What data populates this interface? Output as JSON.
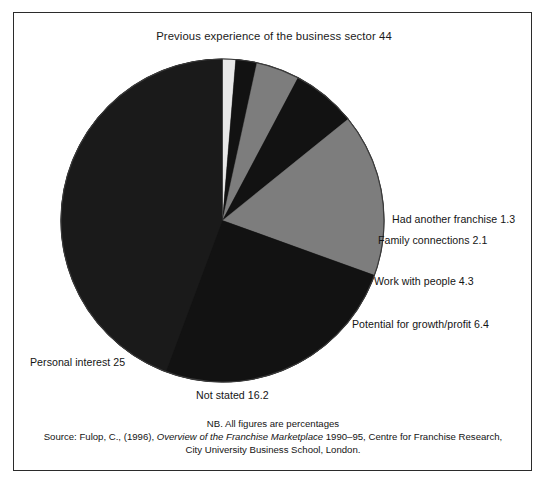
{
  "figure": {
    "title": "Previous experience of the business sector 44",
    "border_color": "#2b2b2b",
    "background": "#ffffff"
  },
  "footnote": {
    "note": "NB. All figures are percentages",
    "source_prefix": "Source: Fulop, C., (1996), ",
    "source_italic": "Overview of the Franchise Marketplace",
    "source_suffix": " 1990–95, Centre for Franchise Research,",
    "source_line3": "City University Business School, London."
  },
  "labels": {
    "had_another_franchise": "Had another franchise 1.3",
    "family_connections": "Family connections 2.1",
    "work_with_people": "Work with people 4.3",
    "potential_growth_profit": "Potential for growth/profit 6.4",
    "personal_interest": "Personal interest 25",
    "not_stated": "Not stated 16.2"
  },
  "chart_data": {
    "type": "pie",
    "title": "Previous experience of the business sector 44",
    "subtitle": "NB. All figures are percentages",
    "units": "percent",
    "start_angle_deg": 0,
    "direction": "clockwise",
    "legend_position": "callout-labels",
    "grid": false,
    "total": 99.3,
    "categories": [
      "Had another franchise",
      "Family connections",
      "Work with people",
      "Potential for growth/profit",
      "Not stated",
      "Personal interest",
      "Previous experience of the business sector"
    ],
    "values": [
      1.3,
      2.1,
      4.3,
      6.4,
      16.2,
      25,
      44
    ],
    "colors": [
      "#e8e8e8",
      "#121212",
      "#7d7d7d",
      "#121212",
      "#7d7d7d",
      "#121212",
      "#1a1a1a"
    ],
    "slices": [
      {
        "label": "Had another franchise",
        "value": 1.3,
        "color": "#e8e8e8"
      },
      {
        "label": "Family connections",
        "value": 2.1,
        "color": "#121212"
      },
      {
        "label": "Work with people",
        "value": 4.3,
        "color": "#7d7d7d"
      },
      {
        "label": "Potential for growth/profit",
        "value": 6.4,
        "color": "#121212"
      },
      {
        "label": "Not stated",
        "value": 16.2,
        "color": "#7d7d7d"
      },
      {
        "label": "Personal interest",
        "value": 25,
        "color": "#121212"
      },
      {
        "label": "Previous experience of the business sector",
        "value": 44,
        "color": "#1a1a1a"
      }
    ]
  }
}
